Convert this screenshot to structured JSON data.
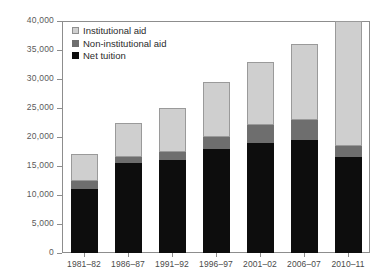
{
  "figure": {
    "top_cropped_text": "",
    "background_color": "#ffffff"
  },
  "axes": {
    "ylabel": "Dollars",
    "ytick_labels": [
      "0",
      "5,000",
      "10,000",
      "15,000",
      "20,000",
      "25,000",
      "30,000",
      "35,000",
      "40,000"
    ],
    "ytick_values": [
      0,
      5000,
      10000,
      15000,
      20000,
      25000,
      30000,
      35000,
      40000
    ]
  },
  "legend": {
    "position": "top-left-inside",
    "entries": [
      {
        "label": "Institutional aid",
        "color": "#cfcfcf"
      },
      {
        "label": "Non-institutional aid",
        "color": "#6e6e6e"
      },
      {
        "label": "Net tuition",
        "color": "#0d0d0d"
      }
    ]
  },
  "chart_data": {
    "type": "bar",
    "stacked": true,
    "title": "",
    "xlabel": "",
    "ylabel": "Dollars",
    "ylim": [
      0,
      40000
    ],
    "ytick_step": 5000,
    "grid": false,
    "legend_position": "top-left-inside",
    "note": "Last bar (2010-11) total exceeds the 40,000 axis maximum and is clipped at the top of the plot area.",
    "categories": [
      "1981–82",
      "1986–87",
      "1991–92",
      "1996–97",
      "2001–02",
      "2006–07",
      "2010–11"
    ],
    "series": [
      {
        "name": "Net tuition",
        "color": "#0d0d0d",
        "values": [
          11000,
          15500,
          16000,
          18000,
          19000,
          19500,
          16500
        ]
      },
      {
        "name": "Non-institutional aid",
        "color": "#6e6e6e",
        "values": [
          1500,
          1000,
          1500,
          2000,
          3000,
          3500,
          2000
        ]
      },
      {
        "name": "Institutional aid",
        "color": "#cfcfcf",
        "values": [
          4500,
          6000,
          7500,
          9500,
          11000,
          13000,
          21500
        ]
      }
    ],
    "totals": [
      17000,
      22500,
      25000,
      29500,
      33000,
      36000,
      40000
    ]
  }
}
